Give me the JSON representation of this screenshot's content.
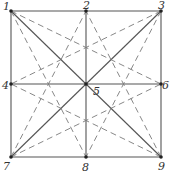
{
  "diagram": {
    "type": "graph",
    "colors": {
      "line": "#555555",
      "dashed": "#7a7a7a",
      "node": "#222222",
      "label": "#333333"
    },
    "nodes": [
      {
        "id": "1",
        "label": "1",
        "x": 11,
        "y": 11,
        "lx": 3,
        "ly": 10
      },
      {
        "id": "2",
        "label": "2",
        "x": 86,
        "y": 11,
        "lx": 83,
        "ly": 9
      },
      {
        "id": "3",
        "label": "3",
        "x": 161,
        "y": 11,
        "lx": 158,
        "ly": 9
      },
      {
        "id": "4",
        "label": "4",
        "x": 11,
        "y": 84,
        "lx": 2,
        "ly": 89
      },
      {
        "id": "5",
        "label": "5",
        "x": 86,
        "y": 84,
        "lx": 93,
        "ly": 95
      },
      {
        "id": "6",
        "label": "6",
        "x": 161,
        "y": 84,
        "lx": 162,
        "ly": 89
      },
      {
        "id": "7",
        "label": "7",
        "x": 11,
        "y": 157,
        "lx": 3,
        "ly": 170
      },
      {
        "id": "8",
        "label": "8",
        "x": 86,
        "y": 157,
        "lx": 82,
        "ly": 171
      },
      {
        "id": "9",
        "label": "9",
        "x": 161,
        "y": 157,
        "lx": 158,
        "ly": 170
      }
    ],
    "solid_edges": [
      [
        "1",
        "3"
      ],
      [
        "3",
        "9"
      ],
      [
        "9",
        "7"
      ],
      [
        "7",
        "1"
      ],
      [
        "2",
        "8"
      ],
      [
        "4",
        "6"
      ],
      [
        "1",
        "9"
      ],
      [
        "3",
        "7"
      ]
    ],
    "dashed_edges": [
      [
        "1",
        "6"
      ],
      [
        "1",
        "8"
      ],
      [
        "3",
        "4"
      ],
      [
        "3",
        "8"
      ],
      [
        "7",
        "2"
      ],
      [
        "7",
        "6"
      ],
      [
        "9",
        "2"
      ],
      [
        "9",
        "4"
      ]
    ]
  }
}
